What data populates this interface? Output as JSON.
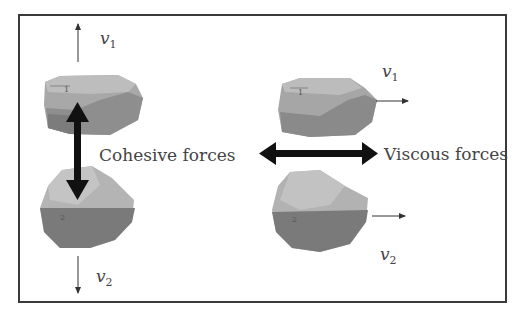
{
  "diagram": {
    "left_panel": {
      "force_label": "Cohesive forces",
      "particle_1_id": "1",
      "particle_2_id": "2",
      "velocity_1": {
        "symbol": "v",
        "subscript": "1",
        "direction": "up"
      },
      "velocity_2": {
        "symbol": "v",
        "subscript": "2",
        "direction": "down"
      }
    },
    "right_panel": {
      "force_label": "Viscous forces",
      "particle_1_id": "1",
      "particle_2_id": "2",
      "velocity_1": {
        "symbol": "v",
        "subscript": "1",
        "direction": "right"
      },
      "velocity_2": {
        "symbol": "v",
        "subscript": "2",
        "direction": "right"
      }
    },
    "colors": {
      "frame": "#3a3a3a",
      "particle_light": "#b5b5b5",
      "particle_mid": "#9a9a9a",
      "particle_dark": "#7a7a7a",
      "arrow": "#111111",
      "text": "#444444"
    }
  }
}
